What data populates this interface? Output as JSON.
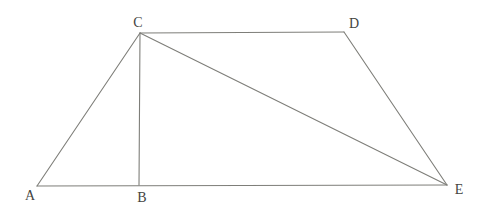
{
  "figure": {
    "background_color": "#ffffff",
    "line_color": "#7e7e79",
    "label_color": "#44443f",
    "points": {
      "A": {
        "label": "A",
        "x": 37,
        "y": 186,
        "label_x": 30,
        "label_y": 200
      },
      "B": {
        "label": "B",
        "x": 139,
        "y": 185,
        "label_x": 142,
        "label_y": 202
      },
      "C": {
        "label": "C",
        "x": 140,
        "y": 33,
        "label_x": 138,
        "label_y": 27
      },
      "D": {
        "label": "D",
        "x": 344,
        "y": 32,
        "label_x": 354,
        "label_y": 28
      },
      "E": {
        "label": "E",
        "x": 447,
        "y": 185,
        "label_x": 459,
        "label_y": 194
      }
    },
    "segments": [
      {
        "from": "A",
        "to": "C"
      },
      {
        "from": "C",
        "to": "D"
      },
      {
        "from": "D",
        "to": "E"
      },
      {
        "from": "A",
        "to": "E"
      },
      {
        "from": "C",
        "to": "B"
      },
      {
        "from": "C",
        "to": "E"
      }
    ]
  }
}
